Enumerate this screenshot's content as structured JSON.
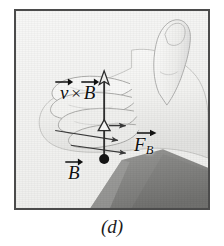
{
  "figure": {
    "caption": "(d)",
    "panel_label": "d",
    "frame": {
      "border_color": "#4b4b4b",
      "background_color": "#f3f3f2"
    },
    "annotations": {
      "cross_product": {
        "name": "v-cross-B-label",
        "operand_left": "v",
        "operator": "×",
        "operand_right": "B",
        "text": "v × B",
        "arrow_over": true,
        "color": "#111111"
      },
      "force": {
        "name": "F-sub-B-label",
        "symbol": "F",
        "subscript": "B",
        "text": "F",
        "arrow_over": true,
        "color": "#111111"
      },
      "field": {
        "name": "B-label",
        "symbol": "B",
        "text": "B",
        "arrow_over": true,
        "color": "#111111"
      }
    },
    "vectors": {
      "vertical_arrow": {
        "name": "v-cross-B-vector-arrow",
        "direction": "up",
        "tail_marker": "filled-circle",
        "mid_marker": "hollow-triangle",
        "head_marker": "open-arrowhead",
        "color": "#2e2e2e"
      },
      "finger_arrow_top": {
        "name": "finger-curl-arrow-upper",
        "direction": "right",
        "color": "#3a3a3a"
      },
      "finger_arrow_bottom": {
        "name": "finger-curl-arrow-lower",
        "direction": "right",
        "color": "#3a3a3a"
      }
    },
    "colors": {
      "ink": "#111111",
      "vector_stroke": "#2e2e2e",
      "hand_light": "#f6f6f5",
      "hand_shade": "#d8d8d6",
      "hand_outline": "#9a9a98",
      "shadow_dark": "#8f8f8d",
      "shadow_darker": "#7c7c7a",
      "paper": "#f3f3f2"
    }
  }
}
